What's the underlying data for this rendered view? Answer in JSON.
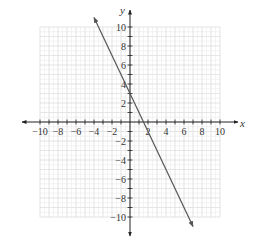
{
  "chart_data": {
    "type": "line",
    "title": "",
    "xlabel": "x",
    "ylabel": "y",
    "xlim": [
      -10,
      10
    ],
    "ylim": [
      -10,
      10
    ],
    "grid": true,
    "x_tick_labels": [
      "-10",
      "-8",
      "-6",
      "-4",
      "-2",
      "2",
      "4",
      "6",
      "8",
      "10"
    ],
    "y_tick_labels": [
      "10",
      "8",
      "6",
      "4",
      "2",
      "-2",
      "-4",
      "-6",
      "-8",
      "-10"
    ],
    "series": [
      {
        "name": "line",
        "equation": "y = -2x + 3",
        "x": [
          -4,
          7
        ],
        "y": [
          11,
          -11
        ],
        "arrows_both_ends": true
      }
    ]
  },
  "colors": {
    "grid": "#e6e6e6",
    "axis": "#222222",
    "line": "#555555"
  }
}
